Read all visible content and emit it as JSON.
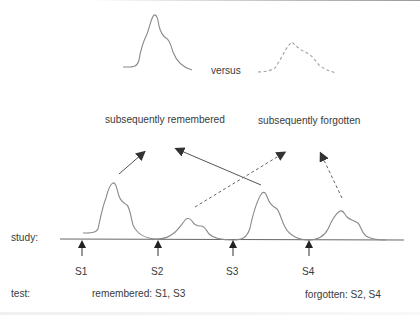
{
  "figure": {
    "legend_top": {
      "left_curve": "solid-waveform",
      "connector": "versus",
      "right_curve": "dashed-waveform"
    },
    "categories": {
      "remembered": "subsequently remembered",
      "forgotten": "subsequently forgotten"
    },
    "rows": {
      "study_label": "study:",
      "test_label": "test:"
    },
    "stimuli": [
      {
        "label": "S1",
        "response": "large",
        "outcome": "remembered"
      },
      {
        "label": "S2",
        "response": "small",
        "outcome": "forgotten"
      },
      {
        "label": "S3",
        "response": "large",
        "outcome": "remembered"
      },
      {
        "label": "S4",
        "response": "small",
        "outcome": "forgotten"
      }
    ],
    "test_results": {
      "remembered": "remembered: S1, S3",
      "forgotten": "forgotten: S2, S4"
    },
    "colors": {
      "line": "#8a8a8a",
      "arrow": "#3a3a3a",
      "text": "#3a3a3a",
      "dashed": "#9a9a9a"
    }
  }
}
